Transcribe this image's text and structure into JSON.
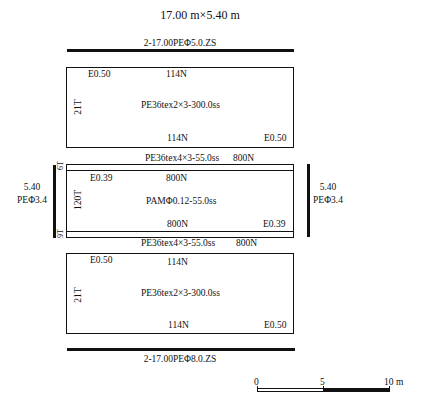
{
  "title": "17.00 m×5.40 m",
  "head_rope": {
    "label": "2-17.00PEΦ5.0.ZS"
  },
  "foot_rope": {
    "label": "2-17.00PEΦ8.0.ZS"
  },
  "upper_wing_panel": {
    "top_left": "E0.50",
    "top_center": "114N",
    "side": "21T",
    "material": "PE36tex2×3-300.0ss",
    "bottom_center": "114N",
    "bottom_right": "E0.50"
  },
  "upper_strip": {
    "label": "PE36tex4×3-55.0ss",
    "count": "800N",
    "side": "6T"
  },
  "middle_panel": {
    "top_left": "E0.39",
    "top_center": "800N",
    "side": "120T",
    "material": "PAMΦ0.12-55.0ss",
    "bottom_center": "800N",
    "bottom_right": "E0.39"
  },
  "lower_strip": {
    "label": "PE36tex4×3-55.0ss",
    "count": "800N",
    "side": "9T"
  },
  "lower_wing_panel": {
    "top_left": "E0.50",
    "top_center": "114N",
    "side": "21T",
    "material": "PE36tex2×3-300.0ss",
    "bottom_center": "114N",
    "bottom_right": "E0.50"
  },
  "side_ropes": {
    "left": {
      "length": "5.40",
      "spec": "PEΦ3.4"
    },
    "right": {
      "length": "5.40",
      "spec": "PEΦ3.4"
    }
  },
  "scale_bar": {
    "ticks": [
      "0",
      "5",
      "10 m"
    ]
  }
}
